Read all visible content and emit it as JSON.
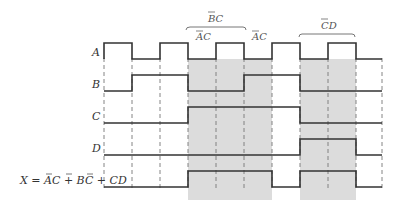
{
  "signals": [
    {
      "name": "A",
      "levels": [
        1,
        0,
        1,
        0,
        1,
        0,
        1,
        0,
        1,
        0
      ]
    },
    {
      "name": "B",
      "levels": [
        0,
        1,
        1,
        0,
        0,
        1,
        1,
        0,
        0,
        0
      ]
    },
    {
      "name": "C",
      "levels": [
        0,
        0,
        0,
        1,
        1,
        1,
        1,
        0,
        0,
        0
      ]
    },
    {
      "name": "D",
      "levels": [
        0,
        0,
        0,
        0,
        0,
        0,
        0,
        1,
        1,
        0
      ]
    },
    {
      "name": "X",
      "levels": [
        0,
        0,
        0,
        1,
        1,
        1,
        0,
        1,
        1,
        0
      ]
    }
  ],
  "labels": {
    "A": "A",
    "B": "B",
    "C": "C",
    "D": "D",
    "X": "X = AC + BC + CD"
  },
  "annotations": {
    "bc": "BC",
    "ac1": "AC",
    "ac2": "AC",
    "cd": "CD"
  },
  "grid": {
    "times": [
      104,
      132,
      160,
      188,
      216,
      244,
      272,
      300,
      328,
      356,
      382
    ]
  },
  "shaded_regions": [
    [
      188,
      272
    ],
    [
      300,
      356
    ]
  ],
  "colors": {
    "line": "#333333",
    "shade": "#d9d9d9",
    "dash": "#777777"
  }
}
